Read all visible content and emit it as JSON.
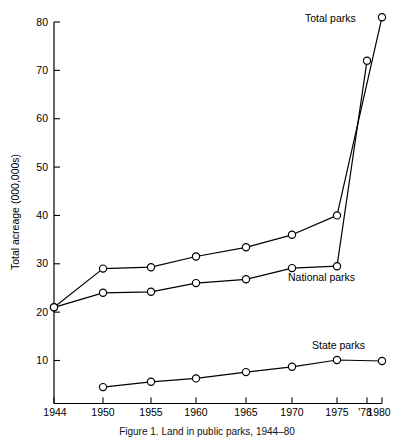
{
  "chart_data": {
    "type": "line",
    "title": "",
    "caption": "Figure 1. Land in public parks, 1944–80",
    "xlabel": "",
    "ylabel": "Total acreage (000,000s)",
    "x": [
      1944,
      1950,
      1955,
      1960,
      1965,
      1970,
      1975,
      1978,
      1980
    ],
    "xtick_labels": [
      "1944",
      "1950",
      "1955",
      "1960",
      "1965",
      "1970",
      "1975",
      "'78",
      "1980"
    ],
    "ytick_labels": [
      "10",
      "20",
      "30",
      "40",
      "50",
      "60",
      "70",
      "80"
    ],
    "ytick_values": [
      10,
      20,
      30,
      40,
      50,
      60,
      70,
      80
    ],
    "xlim": [
      1944,
      1980
    ],
    "ylim": [
      0,
      83
    ],
    "grid": false,
    "legend_position": "inline-labels",
    "marker": "open-circle",
    "series": [
      {
        "name": "Total parks",
        "label": "Total parks",
        "x": [
          1944,
          1950,
          1955,
          1960,
          1965,
          1970,
          1975,
          1980
        ],
        "values": [
          21.0,
          29.0,
          29.3,
          31.5,
          33.4,
          36.0,
          40.0,
          81.0
        ]
      },
      {
        "name": "National parks",
        "label": "National parks",
        "x": [
          1944,
          1950,
          1955,
          1960,
          1965,
          1970,
          1975,
          1978
        ],
        "values": [
          21.0,
          24.0,
          24.2,
          26.0,
          26.8,
          29.1,
          29.5,
          72.0
        ]
      },
      {
        "name": "State parks",
        "label": "State parks",
        "x": [
          1950,
          1955,
          1960,
          1965,
          1970,
          1975,
          1980
        ],
        "values": [
          4.5,
          5.6,
          6.3,
          7.6,
          8.7,
          10.1,
          9.9
        ]
      }
    ]
  },
  "labels": {
    "total_parks": "Total parks",
    "national_parks": "National parks",
    "state_parks": "State parks"
  },
  "colors": {
    "ink": "#000000",
    "background": "#ffffff"
  }
}
